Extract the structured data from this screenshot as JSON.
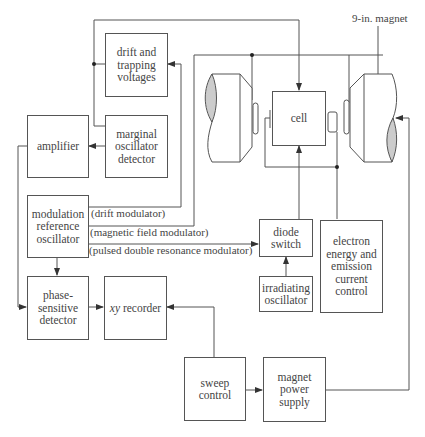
{
  "diagram": {
    "title": "",
    "line_color": "#555555",
    "pole_fill": "#cccccc",
    "blocks": {
      "drift_trapping": "drift and\ntrapping\nvoltages",
      "marginal_osc": "marginal\noscillator\ndetector",
      "amplifier": "amplifier",
      "mod_ref_osc": "modulation\nreference\noscillator",
      "phase_sensitive": "phase-\nsensitive\ndetector",
      "xy_recorder_italic": "xy",
      "xy_recorder_rest": " recorder",
      "cell": "cell",
      "diode_switch": "diode\nswitch",
      "irradiating_osc": "irradiating\noscillator",
      "electron_energy": "electron\nenergy and\nemission\ncurrent\ncontrol",
      "sweep_control": "sweep\ncontrol",
      "magnet_power": "magnet\npower\nsupply"
    },
    "labels": {
      "magnet": "9-in. magnet",
      "drift_modulator": "(drift modulator)",
      "field_modulator": "(magnetic field modulator)",
      "pulsed_modulator": "(pulsed double resonance modulator)",
      "filament": "ooo"
    }
  }
}
